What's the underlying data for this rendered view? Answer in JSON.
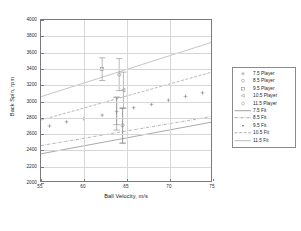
{
  "chart_data": {
    "type": "scatter",
    "title": "",
    "xlabel": "Ball Velocity, m/s",
    "ylabel": "Back Spin, rpm",
    "xlim": [
      55,
      75
    ],
    "ylim": [
      2000,
      4000
    ],
    "xticks": [
      55,
      60,
      65,
      70,
      75
    ],
    "yticks": [
      2000,
      2200,
      2400,
      2600,
      2800,
      3000,
      3200,
      3400,
      3600,
      3800,
      4000
    ],
    "grid": true,
    "legend_position": "right-outside",
    "legend_entries": [
      {
        "label": "7.5 Player",
        "kind": "marker",
        "marker": "plus",
        "color": "#8c8c8c"
      },
      {
        "label": "8.5 Player",
        "kind": "marker",
        "marker": "circle",
        "color": "#9a9a9a"
      },
      {
        "label": "9.5 Player",
        "kind": "marker",
        "marker": "square",
        "color": "#8f8f8f"
      },
      {
        "label": "10.5 Player",
        "kind": "marker",
        "marker": "triangle-left",
        "color": "#9a9a9a"
      },
      {
        "label": "11.5 Player",
        "kind": "marker",
        "marker": "circle-open",
        "color": "#a3a3a3"
      },
      {
        "label": "7.5 Fit",
        "kind": "line",
        "dash": "solid",
        "color": "#808080"
      },
      {
        "label": "8.5 Fit",
        "kind": "line",
        "dash": "dashdot",
        "color": "#8c8c8c"
      },
      {
        "label": "9.5 Fit",
        "kind": "line",
        "dash": "dot",
        "color": "#555555"
      },
      {
        "label": "10.5 Fit",
        "kind": "line",
        "dash": "dashed",
        "color": "#9a9a9a"
      },
      {
        "label": "11.5 Fit",
        "kind": "line",
        "dash": "solid-light",
        "color": "#bcbcbc"
      }
    ],
    "series": [
      {
        "name": "9.5 Player",
        "marker": "plus",
        "color": "#7d7d7d",
        "points": [
          {
            "x": 56.0,
            "y": 2683
          },
          {
            "x": 58.0,
            "y": 2735
          },
          {
            "x": 60.0,
            "y": 2775
          },
          {
            "x": 62.2,
            "y": 2818
          },
          {
            "x": 65.9,
            "y": 2910
          },
          {
            "x": 68.0,
            "y": 2952
          },
          {
            "x": 70.0,
            "y": 3004
          },
          {
            "x": 72.0,
            "y": 3052
          },
          {
            "x": 74.0,
            "y": 3095
          }
        ]
      },
      {
        "name": "error-bar-cluster",
        "marker": "varied",
        "color": "#8a8a8a",
        "errorbars": [
          {
            "x": 62.2,
            "y": 3392,
            "lo": 3248,
            "hi": 3530,
            "marker": "square"
          },
          {
            "x": 64.2,
            "y": 3322,
            "lo": 3122,
            "hi": 3520,
            "marker": "circle"
          },
          {
            "x": 64.7,
            "y": 3128,
            "lo": 2905,
            "hi": 3352,
            "marker": "triangle-left"
          },
          {
            "x": 63.9,
            "y": 2862,
            "lo": 2700,
            "hi": 3040,
            "marker": "plus"
          },
          {
            "x": 64.6,
            "y": 2692,
            "lo": 2470,
            "hi": 2905,
            "marker": "circle-open"
          },
          {
            "x": 63.9,
            "y": 2818,
            "lo": 2632,
            "hi": 3042,
            "marker": "none"
          },
          {
            "x": 64.6,
            "y": 2588,
            "lo": 2470,
            "hi": 2905,
            "marker": "none"
          }
        ]
      }
    ],
    "fits": [
      {
        "name": "7.5 Fit",
        "x0": 55,
        "y0": 2338,
        "x1": 75,
        "y1": 2730,
        "dash": "solid",
        "color": "#8a8a8a"
      },
      {
        "name": "8.5 Fit",
        "x0": 55,
        "y0": 2440,
        "x1": 75,
        "y1": 2800,
        "dash": "dashdot",
        "color": "#9a9a9a"
      },
      {
        "name": "10.5 Fit",
        "x0": 55,
        "y0": 2757,
        "x1": 75,
        "y1": 3350,
        "dash": "dashed",
        "color": "#9e9e9e"
      },
      {
        "name": "11.5 Fit",
        "x0": 55,
        "y0": 3047,
        "x1": 75,
        "y1": 3720,
        "dash": "solid-light",
        "color": "#c4c4c4"
      }
    ]
  }
}
